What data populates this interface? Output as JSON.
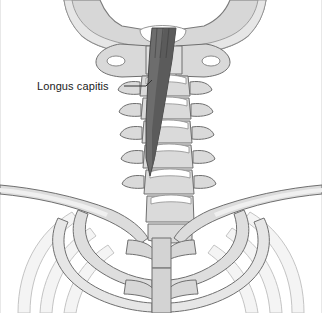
{
  "figure": {
    "name": "cervical-spine-longus-capitis",
    "width": 322,
    "height": 313,
    "background_color": "#ffffff",
    "style": "grayscale medical line illustration"
  },
  "labels": [
    {
      "id": "longus-capitis",
      "text": "Longus capitis",
      "x": 37,
      "y": 90,
      "leader_line": {
        "from_x": 124,
        "from_y": 86,
        "to_x": 152,
        "to_y": 80
      }
    }
  ],
  "colors": {
    "bone_fill": "#d9d9d9",
    "bone_fill_light": "#e4e4e4",
    "bone_fill_pale": "#eeeeee",
    "bone_outline": "#6f6f6f",
    "bone_outline_soft": "#9a9a9a",
    "muscle_fill": "#6e6e6e",
    "muscle_fill_dark": "#565656",
    "muscle_outline": "#3f3f3f",
    "rib_faint": "#f2f2f2",
    "rib_faint_outline": "#bdbdbd",
    "text_color": "#1b1b1b",
    "frame_edge": "#e8e8e8"
  },
  "structures": {
    "skull_base": {
      "name": "occipital bone / skull base",
      "description": "broad light-gray wings spanning the top of the image"
    },
    "atlas": {
      "name": "C1 atlas",
      "description": "winged vertebra with oval transverse foramina"
    },
    "cervical_vertebrae": {
      "name": "cervical vertebrae C2-C7",
      "count": 6,
      "description": "stacked vertebral bodies with lateral transverse processes"
    },
    "longus_capitis_muscle": {
      "name": "longus capitis",
      "description": "dark gray striated muscle band descending from skull base along anterior cervical spine, tapering inferiorly"
    },
    "clavicles": {
      "name": "clavicles",
      "count": 2,
      "description": "paired bones sweeping laterally to the image edges"
    },
    "sternum": {
      "name": "sternum (manubrium and body)",
      "description": "central vertical gray column in lower thorax"
    },
    "first_ribs": {
      "name": "first ribs",
      "count": 2,
      "description": "curved bones arcing beneath the clavicles to the sternum"
    },
    "lower_ribs": {
      "name": "lower ribs",
      "count": 6,
      "description": "faint pale arcs in the lower corners of the image"
    }
  }
}
